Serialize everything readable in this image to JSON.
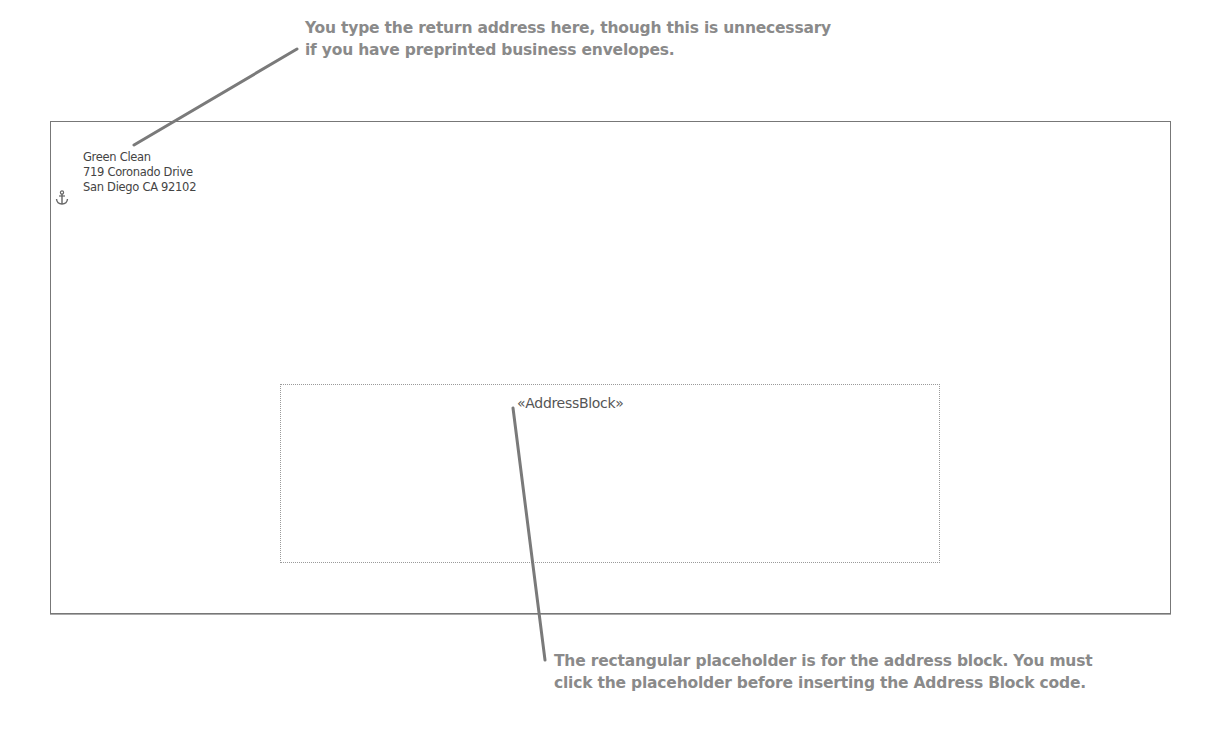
{
  "callouts": {
    "top": {
      "lines": [
        "You type the return address here, though this is unnecessary",
        "if you have preprinted business envelopes."
      ]
    },
    "bottom": {
      "lines": [
        "The rectangular placeholder is for the address block. You must",
        "click the placeholder before inserting the Address Block code."
      ]
    }
  },
  "envelope": {
    "return_address": {
      "lines": [
        "Green Clean",
        "719 Coronado Drive",
        "San Diego CA 92102"
      ]
    },
    "anchor_icon": "anchor-icon",
    "address_placeholder": {
      "field_code": "«AddressBlock»"
    }
  },
  "colors": {
    "callout_text": "#8a8a8a",
    "leader_line": "#7a7a7a",
    "envelope_border": "#777777",
    "placeholder_border": "#9a9a9a"
  }
}
